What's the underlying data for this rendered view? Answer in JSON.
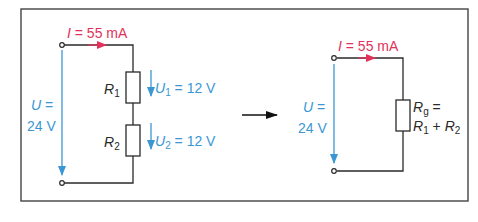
{
  "diagram": {
    "colors": {
      "current": "#e0325a",
      "voltage": "#3a97d4",
      "wire": "#2a2a2a",
      "frame": "#444444"
    },
    "left_circuit": {
      "current_label": {
        "symbol": "I",
        "text": " = 55 mA"
      },
      "source_voltage": {
        "symbol": "U",
        "line1": " =",
        "line2": "24 V"
      },
      "resistors": [
        {
          "name": "R",
          "sub": "1",
          "voltage_symbol": "U",
          "voltage_sub": "1",
          "voltage_text": " = 12 V"
        },
        {
          "name": "R",
          "sub": "2",
          "voltage_symbol": "U",
          "voltage_sub": "2",
          "voltage_text": " = 12 V"
        }
      ]
    },
    "transform_arrow": "right-arrow",
    "right_circuit": {
      "current_label": {
        "symbol": "I",
        "text": " = 55 mA"
      },
      "source_voltage": {
        "symbol": "U",
        "line1": " =",
        "line2": "24 V"
      },
      "equivalent_resistor": {
        "name": "R",
        "sub": "g",
        "eq": " =",
        "line2": [
          {
            "name": "R",
            "sub": "1"
          },
          {
            "op": " + "
          },
          {
            "name": "R",
            "sub": "2"
          }
        ]
      }
    }
  }
}
